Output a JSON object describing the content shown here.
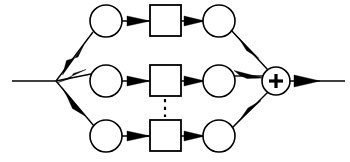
{
  "diagram": {
    "type": "block-diagram",
    "background_color": "#ffffff",
    "line_color": "#000000",
    "canvas": {
      "width": 350,
      "height": 162
    },
    "input": {
      "label": "",
      "line": {
        "x1": 12,
        "y1": 81,
        "x2": 56,
        "y2": 81
      }
    },
    "split_node": {
      "x": 56,
      "y": 81,
      "label": ""
    },
    "summer": {
      "name": "summing-junction",
      "symbol": "+",
      "cx": 276,
      "cy": 81,
      "r": 14,
      "label": ""
    },
    "output": {
      "label": "",
      "line": {
        "x1": 290,
        "y1": 81,
        "x2": 345,
        "y2": 81
      }
    },
    "ellipsis": {
      "name": "vertical-dashed-ellipsis",
      "x": 165,
      "y1": 99,
      "y2": 117,
      "style": "dashed"
    },
    "branches": [
      {
        "id": "branch-top",
        "row_y": 21,
        "label": "",
        "input_circle": {
          "cx": 106,
          "cy": 21,
          "r": 16,
          "label": ""
        },
        "block_square": {
          "x": 150,
          "y": 5,
          "w": 31,
          "h": 31,
          "label": ""
        },
        "output_circle": {
          "cx": 219,
          "cy": 21,
          "r": 16,
          "label": ""
        }
      },
      {
        "id": "branch-middle",
        "row_y": 81,
        "label": "",
        "input_circle": {
          "cx": 106,
          "cy": 81,
          "r": 16,
          "label": ""
        },
        "block_square": {
          "x": 150,
          "y": 65,
          "w": 31,
          "h": 31,
          "label": ""
        },
        "output_circle": {
          "cx": 219,
          "cy": 81,
          "r": 16,
          "label": ""
        }
      },
      {
        "id": "branch-bottom",
        "row_y": 136,
        "label": "",
        "input_circle": {
          "cx": 106,
          "cy": 136,
          "r": 16,
          "label": ""
        },
        "block_square": {
          "x": 150,
          "y": 120,
          "w": 31,
          "h": 31,
          "label": ""
        },
        "output_circle": {
          "cx": 219,
          "cy": 136,
          "r": 16,
          "label": ""
        }
      }
    ]
  }
}
